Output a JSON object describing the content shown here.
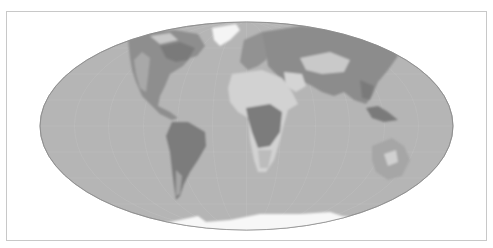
{
  "map": {
    "projection": "mollweide",
    "style": "grayscale",
    "colors": {
      "background": "#ffffff",
      "frame": "#c8c8c8",
      "ocean": "#b5b5b5",
      "graticule": "#c6c6c6",
      "land_dark": "#7e7e7e",
      "land_mid": "#9a9a9a",
      "land_light": "#d2d2d2",
      "ice": "#f7f7f7"
    },
    "features": [
      "north-america",
      "greenland",
      "south-america",
      "europe",
      "africa",
      "asia",
      "australia",
      "antarctica"
    ]
  }
}
